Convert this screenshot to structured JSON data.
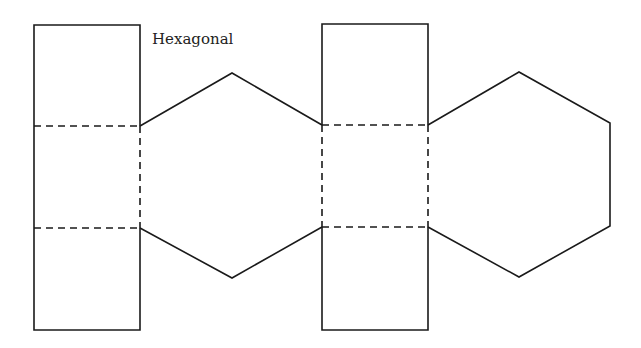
{
  "diagram": {
    "title": "Hexagonal",
    "colors": {
      "line": "#1a1a1a",
      "background": "#ffffff"
    },
    "legend": {
      "solid_line": "cut edge",
      "dashed_line": "fold line"
    }
  }
}
